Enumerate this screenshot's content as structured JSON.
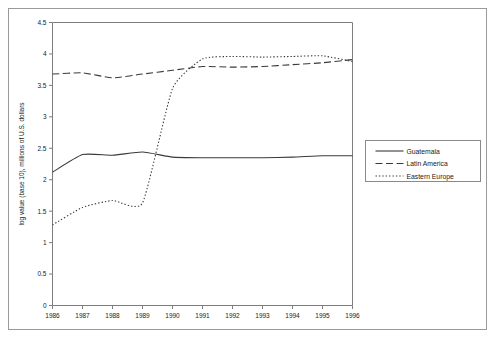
{
  "chart_data": {
    "type": "line",
    "title": "",
    "subtitle": "",
    "xlabel": "",
    "ylabel": "log value (base 10), millions of U.S. dollars",
    "x": [
      1986,
      1987,
      1988,
      1989,
      1990,
      1991,
      1992,
      1993,
      1994,
      1995,
      1996
    ],
    "categories": [
      "1986",
      "1987",
      "1988",
      "1989",
      "1990",
      "1991",
      "1992",
      "1993",
      "1994",
      "1995",
      "1996"
    ],
    "xlim": [
      1986,
      1996
    ],
    "ylim": [
      0,
      4.5
    ],
    "yticks": [
      0,
      0.5,
      1,
      1.5,
      2,
      2.5,
      3,
      3.5,
      4,
      4.5
    ],
    "ytick_labels": [
      "0",
      "0.5",
      "1",
      "1.5",
      "2",
      "2.5",
      "3",
      "3.5",
      "4",
      "4.5"
    ],
    "grid": false,
    "legend_position": "right",
    "series": [
      {
        "name": "Guatemala",
        "style": "solid",
        "color": "#3a3a3a",
        "values": [
          2.12,
          2.4,
          2.39,
          2.44,
          2.36,
          2.35,
          2.35,
          2.35,
          2.36,
          2.38,
          2.38
        ]
      },
      {
        "name": "Latin America",
        "style": "dashed",
        "color": "#3a3a3a",
        "values": [
          3.68,
          3.7,
          3.62,
          3.68,
          3.74,
          3.8,
          3.79,
          3.8,
          3.83,
          3.86,
          3.91
        ]
      },
      {
        "name": "Eastern Europe",
        "style": "dotted",
        "color": "#3a3a3a",
        "values": [
          1.28,
          1.56,
          1.67,
          1.63,
          3.45,
          3.92,
          3.96,
          3.95,
          3.96,
          3.97,
          3.88
        ]
      }
    ]
  },
  "legend": {
    "entries": [
      {
        "label": "Guatemala",
        "style": "solid"
      },
      {
        "label": "Latin America",
        "style": "dashed"
      },
      {
        "label": "Eastern Europe",
        "style": "dotted"
      }
    ]
  }
}
